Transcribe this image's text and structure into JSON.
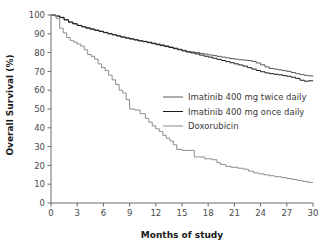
{
  "chart_data": {
    "type": "line",
    "title": "",
    "xlabel": "Months of study",
    "ylabel": "Overall Survival (%)",
    "xlim": [
      0,
      30
    ],
    "ylim": [
      0,
      100
    ],
    "xticks": [
      0,
      3,
      6,
      9,
      12,
      15,
      18,
      21,
      24,
      27,
      30
    ],
    "yticks": [
      0,
      10,
      20,
      30,
      40,
      50,
      60,
      70,
      80,
      90,
      100
    ],
    "grid": false,
    "legend_position": "center-right",
    "step_plot": true,
    "series": [
      {
        "name": "Imatinib 400 mg twice daily",
        "color": "#595959",
        "x": [
          0,
          0.5,
          1.0,
          1.5,
          2.0,
          2.5,
          3.0,
          3.5,
          4.0,
          4.5,
          5.0,
          5.5,
          6.0,
          6.5,
          7.0,
          7.5,
          8.0,
          8.5,
          9.0,
          9.5,
          10.0,
          10.5,
          11.0,
          11.5,
          12.0,
          12.5,
          13.0,
          13.5,
          14.0,
          14.5,
          15.0,
          15.5,
          16.0,
          16.5,
          17.0,
          17.5,
          18.0,
          18.5,
          19.0,
          19.5,
          20.0,
          20.5,
          21.0,
          21.5,
          22.0,
          22.5,
          23.0,
          23.5,
          24.0,
          24.5,
          25.0,
          25.5,
          26.0,
          26.5,
          27.0,
          27.5,
          28.0,
          28.5,
          29.0,
          29.5,
          30.0
        ],
        "y": [
          100,
          99.5,
          98.8,
          97.5,
          96.3,
          95.4,
          94.5,
          93.8,
          93.2,
          92.6,
          92.0,
          91.4,
          90.8,
          90.2,
          89.6,
          89.0,
          88.4,
          87.9,
          87.4,
          86.9,
          86.4,
          86.0,
          85.6,
          85.1,
          84.6,
          84.1,
          83.6,
          83.0,
          82.4,
          81.8,
          81.2,
          80.6,
          80.3,
          80.0,
          79.6,
          79.2,
          78.8,
          78.4,
          78.0,
          77.6,
          77.2,
          76.8,
          76.5,
          76.2,
          76.0,
          75.8,
          75.3,
          74.5,
          73.5,
          72.4,
          71.6,
          71.2,
          70.8,
          70.4,
          70.0,
          69.4,
          68.8,
          68.3,
          67.9,
          67.6,
          67.3
        ]
      },
      {
        "name": "Imatinib 400 mg once daily",
        "color": "#1a1a1a",
        "x": [
          0,
          0.5,
          1.0,
          1.5,
          2.0,
          2.5,
          3.0,
          3.5,
          4.0,
          4.5,
          5.0,
          5.5,
          6.0,
          6.5,
          7.0,
          7.5,
          8.0,
          8.5,
          9.0,
          9.5,
          10.0,
          10.5,
          11.0,
          11.5,
          12.0,
          12.5,
          13.0,
          13.5,
          14.0,
          14.5,
          15.0,
          15.5,
          16.0,
          16.5,
          17.0,
          17.5,
          18.0,
          18.5,
          19.0,
          19.5,
          20.0,
          20.5,
          21.0,
          21.5,
          22.0,
          22.5,
          23.0,
          23.5,
          24.0,
          24.5,
          25.0,
          25.5,
          26.0,
          26.5,
          27.0,
          27.5,
          28.0,
          28.5,
          29.0,
          29.5,
          30.0
        ],
        "y": [
          100,
          99.4,
          98.6,
          97.4,
          96.2,
          95.3,
          94.4,
          93.7,
          93.0,
          92.4,
          91.8,
          91.2,
          90.6,
          90.0,
          89.4,
          88.8,
          88.2,
          87.7,
          87.2,
          86.7,
          86.2,
          85.8,
          85.3,
          84.8,
          84.2,
          83.7,
          83.2,
          82.7,
          82.1,
          81.5,
          80.9,
          80.3,
          79.8,
          79.3,
          78.7,
          78.1,
          77.6,
          77.0,
          76.4,
          75.8,
          75.2,
          74.6,
          74.0,
          73.4,
          72.8,
          72.0,
          71.2,
          70.5,
          69.8,
          69.2,
          68.8,
          68.5,
          68.2,
          67.8,
          67.4,
          66.9,
          66.3,
          65.3,
          64.8,
          65.0,
          65.0
        ]
      },
      {
        "name": "Doxorubicin",
        "color": "#8c8c8c",
        "x": [
          0,
          0.6,
          1.0,
          1.4,
          1.8,
          2.2,
          2.6,
          3.0,
          3.4,
          3.8,
          4.2,
          4.6,
          5.0,
          5.4,
          5.8,
          6.2,
          6.6,
          7.0,
          7.4,
          7.8,
          8.2,
          8.6,
          9.0,
          9.6,
          10.2,
          10.8,
          11.2,
          11.6,
          12.0,
          12.4,
          12.8,
          13.2,
          13.6,
          14.0,
          14.4,
          15.0,
          16.0,
          16.4,
          17.0,
          17.6,
          18.4,
          19.0,
          19.4,
          20.0,
          20.6,
          21.4,
          22.0,
          22.6,
          23.2,
          23.8,
          24.4,
          25.0,
          25.6,
          26.4,
          27.0,
          27.6,
          28.2,
          28.8,
          29.4,
          30.0
        ],
        "y": [
          100,
          98.0,
          93.0,
          90.5,
          88.0,
          86.5,
          85.5,
          84.5,
          83.5,
          81.5,
          79.0,
          78.0,
          76.5,
          74.0,
          72.0,
          70.5,
          68.0,
          65.5,
          63.0,
          60.0,
          58.5,
          55.0,
          50.0,
          49.5,
          47.5,
          45.0,
          43.0,
          41.0,
          39.5,
          38.0,
          36.0,
          34.5,
          33.0,
          31.0,
          28.5,
          28.0,
          28.0,
          24.5,
          24.5,
          23.5,
          23.0,
          21.5,
          20.5,
          19.5,
          19.0,
          18.5,
          18.0,
          17.0,
          16.0,
          15.5,
          15.0,
          14.5,
          14.0,
          13.5,
          13.0,
          12.5,
          12.0,
          11.5,
          11.0,
          11.0
        ]
      }
    ]
  },
  "legend": {
    "entries": [
      {
        "label": "Imatinib 400 mg twice daily",
        "color": "#595959"
      },
      {
        "label": "Imatinib 400 mg once daily",
        "color": "#1a1a1a"
      },
      {
        "label": "Doxorubicin",
        "color": "#8c8c8c"
      }
    ]
  },
  "axes": {
    "x_title": "Months of study",
    "y_title": "Overall Survival (%)",
    "x_tick_labels": [
      "0",
      "3",
      "6",
      "9",
      "12",
      "15",
      "18",
      "21",
      "24",
      "27",
      "30"
    ],
    "y_tick_labels": [
      "0",
      "10",
      "20",
      "30",
      "40",
      "50",
      "60",
      "70",
      "80",
      "90",
      "100"
    ]
  }
}
